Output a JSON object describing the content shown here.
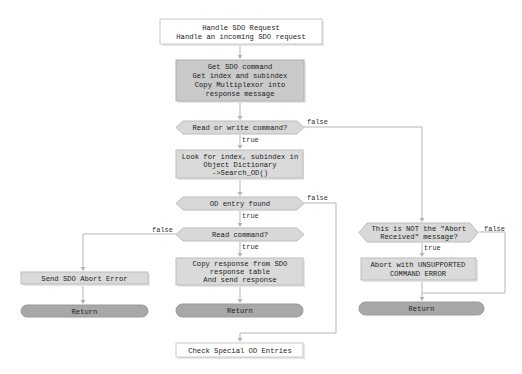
{
  "diagram": {
    "title": "Handle SDO Request",
    "nodes": {
      "start": {
        "lines": [
          "Handle SDO Request",
          "Handle an incoming SDO request"
        ],
        "shape": "process-white"
      },
      "get_cmd": {
        "lines": [
          "Get SDO command",
          "Get index and subindex",
          "Copy Multiplexor into",
          "response message"
        ],
        "shape": "process"
      },
      "dec_rw": {
        "lines": [
          "Read or write command?"
        ],
        "shape": "decision"
      },
      "search_od": {
        "lines": [
          "Look for index, subindex in",
          "Object Dictionary",
          "->Search_OD()"
        ],
        "shape": "process"
      },
      "dec_found": {
        "lines": [
          "OD entry found"
        ],
        "shape": "decision"
      },
      "dec_read": {
        "lines": [
          "Read command?"
        ],
        "shape": "decision"
      },
      "send_abort": {
        "lines": [
          "Send SDO Abort Error"
        ],
        "shape": "process"
      },
      "return_1": {
        "lines": [
          "Return"
        ],
        "shape": "terminal"
      },
      "copy_resp": {
        "lines": [
          "Copy response from SDO",
          "response table",
          "And send response"
        ],
        "shape": "process"
      },
      "return_2": {
        "lines": [
          "Return"
        ],
        "shape": "terminal"
      },
      "check_special": {
        "lines": [
          "Check Special OD Entries"
        ],
        "shape": "process-white"
      },
      "dec_abort_recv": {
        "lines": [
          "This is NOT the \"Abort",
          "Received\"  message?"
        ],
        "shape": "decision"
      },
      "abort_unsupported": {
        "lines": [
          "Abort with UNSUPPORTED",
          "COMMAND ERROR"
        ],
        "shape": "process"
      },
      "return_3": {
        "lines": [
          "Return"
        ],
        "shape": "terminal"
      }
    },
    "edges": [
      {
        "from": "start",
        "to": "get_cmd",
        "label": ""
      },
      {
        "from": "get_cmd",
        "to": "dec_rw",
        "label": ""
      },
      {
        "from": "dec_rw",
        "to": "search_od",
        "label": "true"
      },
      {
        "from": "dec_rw",
        "to": "dec_abort_recv",
        "label": "false"
      },
      {
        "from": "search_od",
        "to": "dec_found",
        "label": ""
      },
      {
        "from": "dec_found",
        "to": "dec_read",
        "label": "true"
      },
      {
        "from": "dec_found",
        "to": "check_special",
        "label": "false"
      },
      {
        "from": "dec_read",
        "to": "copy_resp",
        "label": "true"
      },
      {
        "from": "dec_read",
        "to": "send_abort",
        "label": "false"
      },
      {
        "from": "send_abort",
        "to": "return_1",
        "label": ""
      },
      {
        "from": "copy_resp",
        "to": "return_2",
        "label": ""
      },
      {
        "from": "dec_abort_recv",
        "to": "abort_unsupported",
        "label": "true"
      },
      {
        "from": "dec_abort_recv",
        "to": "return_3",
        "label": "false"
      },
      {
        "from": "abort_unsupported",
        "to": "return_3",
        "label": ""
      }
    ],
    "labels": {
      "true": "true",
      "false": "false"
    }
  }
}
